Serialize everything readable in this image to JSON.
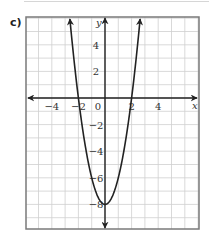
{
  "part_label": "c)",
  "chart_data": {
    "type": "line",
    "title": "",
    "function": "y = 2x^2 - 8",
    "xlabel": "x",
    "ylabel": "y",
    "xlim": [
      -5.9,
      7.0
    ],
    "ylim": [
      -9.8,
      6.1
    ],
    "grid": true,
    "x_ticks": [
      -4,
      -2,
      0,
      2,
      4
    ],
    "y_ticks": [
      4,
      2,
      -2,
      -4,
      -6,
      -8
    ],
    "x_tick_labels": [
      "−4",
      "−2",
      "0",
      "2",
      "4"
    ],
    "y_tick_labels": [
      "4",
      "2",
      "−2",
      "−4",
      "−6",
      "−8"
    ],
    "vertex": [
      0,
      -8
    ],
    "roots": [
      -2,
      2
    ],
    "series": [
      {
        "name": "parabola",
        "x": [
          -2.65,
          -2.5,
          -2,
          -1.5,
          -1,
          -0.5,
          0,
          0.5,
          1,
          1.5,
          2,
          2.5,
          2.65
        ],
        "y": [
          6.0,
          4.5,
          0,
          -3.5,
          -6,
          -7.5,
          -8,
          -7.5,
          -6,
          -3.5,
          0,
          4.5,
          6.0
        ]
      }
    ]
  },
  "style": {
    "grid_color": "#cfcfcf",
    "frame_color": "#7a7a7a",
    "curve_color": "#222222",
    "axis_color": "#222222"
  }
}
